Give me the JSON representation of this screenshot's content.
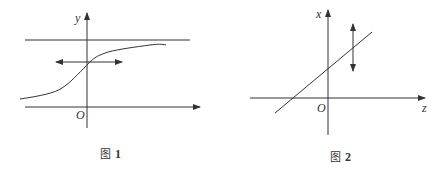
{
  "figures": [
    {
      "id": "fig1",
      "caption_prefix": "图",
      "caption_number": "1",
      "axis_labels": {
        "vertical": "y",
        "origin": "O"
      },
      "elements": {
        "horizontal_asymptote": "line",
        "curve": "S-shaped increasing curve",
        "double_arrow": "horizontal bidirectional arrow"
      }
    },
    {
      "id": "fig2",
      "caption_prefix": "图",
      "caption_number": "2",
      "axis_labels": {
        "vertical": "x",
        "horizontal": "z",
        "origin": "O"
      },
      "elements": {
        "line": "straight line with positive slope",
        "double_arrow": "vertical bidirectional arrow"
      }
    }
  ],
  "colors": {
    "stroke": "#333333",
    "text": "#333333"
  }
}
